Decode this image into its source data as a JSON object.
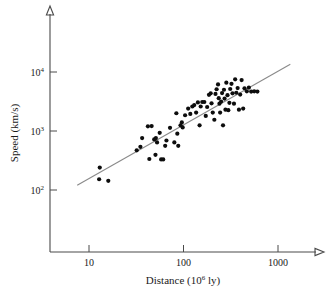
{
  "chart_data": {
    "type": "scatter",
    "title": "",
    "xlabel": "Distance (10⁶ ly)",
    "xlabel_base": "Distance (10",
    "xlabel_exp": "6",
    "xlabel_tail": " ly)",
    "ylabel": "Speed (km/s)",
    "xscale": "log",
    "yscale": "log",
    "xlim": [
      5,
      2000
    ],
    "ylim": [
      60,
      30000
    ],
    "grid": false,
    "legend": null,
    "xticks": [
      {
        "value": 10,
        "label": "10"
      },
      {
        "value": 100,
        "label": "100"
      },
      {
        "value": 1000,
        "label": "1000"
      }
    ],
    "yticks": [
      {
        "value": 100,
        "label": "10",
        "exponent": "2"
      },
      {
        "value": 1000,
        "label": "10",
        "exponent": "3"
      },
      {
        "value": 10000,
        "label": "10",
        "exponent": "4"
      }
    ],
    "trendline": {
      "label": "Hubble law fit",
      "color": "#8a8a8a",
      "x_start": 7.5,
      "y_start": 120,
      "x_end": 1350,
      "y_end": 13500
    },
    "point_color": "#0d0d0d",
    "point_radius": 2.1,
    "points": [
      {
        "x": 13.0,
        "y": 240
      },
      {
        "x": 12.8,
        "y": 152
      },
      {
        "x": 16.0,
        "y": 143
      },
      {
        "x": 32.0,
        "y": 470
      },
      {
        "x": 35.0,
        "y": 540
      },
      {
        "x": 36.5,
        "y": 760
      },
      {
        "x": 42.0,
        "y": 1200
      },
      {
        "x": 46.0,
        "y": 1210
      },
      {
        "x": 43.5,
        "y": 335
      },
      {
        "x": 49.0,
        "y": 720
      },
      {
        "x": 51.0,
        "y": 760
      },
      {
        "x": 52.5,
        "y": 640
      },
      {
        "x": 50.5,
        "y": 395
      },
      {
        "x": 56.0,
        "y": 930
      },
      {
        "x": 58.0,
        "y": 330
      },
      {
        "x": 61.0,
        "y": 330
      },
      {
        "x": 64.0,
        "y": 560
      },
      {
        "x": 66.0,
        "y": 690
      },
      {
        "x": 72.0,
        "y": 1130
      },
      {
        "x": 80.0,
        "y": 640
      },
      {
        "x": 84.0,
        "y": 2000
      },
      {
        "x": 86.0,
        "y": 900
      },
      {
        "x": 88.0,
        "y": 560
      },
      {
        "x": 93.0,
        "y": 1250
      },
      {
        "x": 96.0,
        "y": 1400
      },
      {
        "x": 98.0,
        "y": 1150
      },
      {
        "x": 104.0,
        "y": 1850
      },
      {
        "x": 112.0,
        "y": 2400
      },
      {
        "x": 118.0,
        "y": 1950
      },
      {
        "x": 124.0,
        "y": 2600
      },
      {
        "x": 130.0,
        "y": 2750
      },
      {
        "x": 136.0,
        "y": 2050
      },
      {
        "x": 142.0,
        "y": 3050
      },
      {
        "x": 148.0,
        "y": 1250
      },
      {
        "x": 152.0,
        "y": 2600
      },
      {
        "x": 158.0,
        "y": 3100
      },
      {
        "x": 166.0,
        "y": 3100
      },
      {
        "x": 172.0,
        "y": 1800
      },
      {
        "x": 178.0,
        "y": 2550
      },
      {
        "x": 186.0,
        "y": 4100
      },
      {
        "x": 194.0,
        "y": 4350
      },
      {
        "x": 198.0,
        "y": 2950
      },
      {
        "x": 204.0,
        "y": 2050
      },
      {
        "x": 212.0,
        "y": 1550
      },
      {
        "x": 218.0,
        "y": 4250
      },
      {
        "x": 224.0,
        "y": 5100
      },
      {
        "x": 232.0,
        "y": 6150
      },
      {
        "x": 236.0,
        "y": 3600
      },
      {
        "x": 240.0,
        "y": 2900
      },
      {
        "x": 244.0,
        "y": 2050
      },
      {
        "x": 250.0,
        "y": 3150
      },
      {
        "x": 256.0,
        "y": 4400
      },
      {
        "x": 262.0,
        "y": 1250
      },
      {
        "x": 268.0,
        "y": 5000
      },
      {
        "x": 272.0,
        "y": 3550
      },
      {
        "x": 278.0,
        "y": 2300
      },
      {
        "x": 284.0,
        "y": 6600
      },
      {
        "x": 292.0,
        "y": 4050
      },
      {
        "x": 298.0,
        "y": 2250
      },
      {
        "x": 306.0,
        "y": 3000
      },
      {
        "x": 312.0,
        "y": 5150
      },
      {
        "x": 322.0,
        "y": 6300
      },
      {
        "x": 330.0,
        "y": 4350
      },
      {
        "x": 342.0,
        "y": 2900
      },
      {
        "x": 352.0,
        "y": 7500
      },
      {
        "x": 362.0,
        "y": 4450
      },
      {
        "x": 374.0,
        "y": 5350
      },
      {
        "x": 386.0,
        "y": 2300
      },
      {
        "x": 398.0,
        "y": 4150
      },
      {
        "x": 412.0,
        "y": 7300
      },
      {
        "x": 428.0,
        "y": 2400
      },
      {
        "x": 442.0,
        "y": 5300
      },
      {
        "x": 468.0,
        "y": 4700
      },
      {
        "x": 492.0,
        "y": 5450
      },
      {
        "x": 520.0,
        "y": 4650
      },
      {
        "x": 560.0,
        "y": 4700
      },
      {
        "x": 605.0,
        "y": 4650
      }
    ]
  },
  "axes": {
    "x_axis_name": "x-axis",
    "y_axis_name": "y-axis",
    "arrow_x_label": "x-axis-arrow",
    "arrow_y_label": "y-axis-arrow"
  }
}
